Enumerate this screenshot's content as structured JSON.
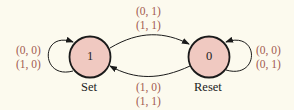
{
  "diagram": {
    "type": "state-transition",
    "states": [
      {
        "id": "set",
        "value": "1",
        "caption": "Set"
      },
      {
        "id": "reset",
        "value": "0",
        "caption": "Reset"
      }
    ],
    "transitions": {
      "set_self": {
        "from": "set",
        "to": "set",
        "line1": "(0, 0)",
        "line2": "(1, 0)"
      },
      "set_to_reset": {
        "from": "set",
        "to": "reset",
        "line1": "(0, 1)",
        "line2": "(1, 1)"
      },
      "reset_to_set": {
        "from": "reset",
        "to": "set",
        "line1": "(1, 0)",
        "line2": "(1, 1)"
      },
      "reset_self": {
        "from": "reset",
        "to": "reset",
        "line1": "(0, 0)",
        "line2": "(0, 1)"
      }
    },
    "colors": {
      "background": "#fcfaee",
      "state_fill": "#f0c9c1",
      "label_text": "#a25a50",
      "stroke": "#1a1a1a"
    }
  }
}
